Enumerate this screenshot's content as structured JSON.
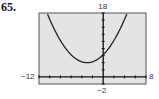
{
  "problem": {
    "number": "65."
  },
  "chart_data": {
    "type": "line",
    "title": "",
    "xlabel": "",
    "ylabel": "",
    "xlim": [
      -12,
      8
    ],
    "ylim": [
      -2,
      18
    ],
    "grid": false,
    "window_labels": {
      "xmin": "−12",
      "xmax": "8",
      "ymin": "−2",
      "ymax": "18"
    },
    "x_tick_step": 2,
    "y_tick_step": 2,
    "series": [
      {
        "name": "f(x)",
        "shape": "parabola opening upward",
        "vertex": [
          -3,
          4
        ],
        "y_intercept": 6.25,
        "equation_estimate": "y = 0.25(x + 3)^2 + 4",
        "x": [
          -10.5,
          -10,
          -9,
          -8,
          -7,
          -6,
          -5,
          -4,
          -3,
          -2,
          -1,
          0,
          1,
          2,
          3,
          4,
          4.5
        ],
        "values": [
          18.06,
          16.25,
          13,
          10.25,
          8,
          6.25,
          5,
          4.25,
          4,
          4.25,
          5,
          6.25,
          8,
          10.25,
          13,
          16.25,
          18.06
        ]
      }
    ]
  },
  "colors": {
    "screen_bg": "#e4e4e4",
    "frame": "#555555",
    "curve": "#222222",
    "axes": "#111111"
  }
}
